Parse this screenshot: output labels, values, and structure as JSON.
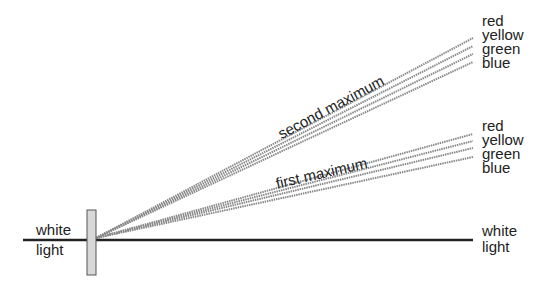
{
  "diagram": {
    "input_label": {
      "line1": "white",
      "line2": "light"
    },
    "output_label": {
      "line1": "white",
      "line2": "light"
    },
    "second_maximum": {
      "label": "second maximum",
      "colors": [
        "red",
        "yellow",
        "green",
        "blue"
      ]
    },
    "first_maximum": {
      "label": "first maximum",
      "colors": [
        "red",
        "yellow",
        "green",
        "blue"
      ]
    },
    "line_color": "#222222",
    "ray_color": "#8a8a8a",
    "grating_fill": "#d8d8d8"
  }
}
